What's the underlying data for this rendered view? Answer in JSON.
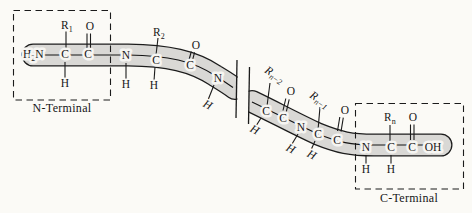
{
  "colors": {
    "band": "#d9d8d5",
    "line": "#1c1c1c",
    "background": "#fbfaf6"
  },
  "terminals": {
    "n_label": "N-Terminal",
    "c_label": "C-Terminal"
  },
  "atoms": {
    "carbon": "C",
    "nitrogen": "N",
    "oxygen": "O",
    "hydrogen": "H",
    "hydroxyl": "OH",
    "amino": {
      "h": "H",
      "sub": "2",
      "n": "N"
    }
  },
  "residues": {
    "r": "R",
    "r1_sub": "1",
    "r2_sub": "2",
    "rn2_sub": "n−2",
    "rn1_sub": "n−1",
    "rn_sub": "n"
  }
}
